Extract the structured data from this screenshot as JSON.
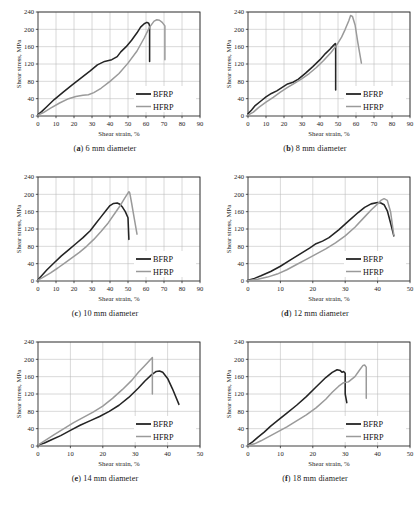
{
  "figure": {
    "panel_captions": [
      {
        "tag": "a",
        "text": " 6 mm diameter"
      },
      {
        "tag": "b",
        "text": " 8 mm diameter"
      },
      {
        "tag": "c",
        "text": " 10 mm diameter"
      },
      {
        "tag": "d",
        "text": " 12 mm diameter"
      },
      {
        "tag": "e",
        "text": " 14 mm diameter"
      },
      {
        "tag": "f",
        "text": " 18 mm diameter"
      }
    ],
    "colors": {
      "bfrp": "#242424",
      "hfrp": "#9a9a9a",
      "grid": "#b9b9b9",
      "axis": "#2b2b2b",
      "background": "#ffffff"
    }
  },
  "chart_data": [
    {
      "id": "a",
      "type": "line",
      "title": "(a) 6 mm diameter",
      "xlabel": "Shear strain, %",
      "ylabel": "Shear stress, MPa",
      "xlim": [
        0,
        90
      ],
      "ylim": [
        0,
        240
      ],
      "xticks": [
        0,
        10,
        20,
        30,
        40,
        50,
        60,
        70,
        80,
        90
      ],
      "yticks": [
        0,
        40,
        80,
        120,
        160,
        200,
        240
      ],
      "grid": true,
      "legend": [
        "BFRP",
        "HFRP"
      ],
      "legend_position": "lower-right",
      "series": [
        {
          "name": "BFRP",
          "x": [
            0,
            2,
            5,
            9,
            14,
            19,
            24,
            29,
            33,
            37,
            41,
            44,
            46,
            49,
            52,
            55,
            57,
            59,
            60.5,
            61.5,
            62,
            62
          ],
          "y": [
            3,
            10,
            22,
            38,
            55,
            72,
            88,
            104,
            118,
            126,
            130,
            137,
            148,
            160,
            175,
            192,
            205,
            213,
            216,
            214,
            208,
            126
          ]
        },
        {
          "name": "HFRP",
          "x": [
            0,
            3,
            7,
            12,
            17,
            21,
            25,
            28,
            31,
            35,
            40,
            45,
            50,
            55,
            59,
            62,
            64.5,
            66,
            67.5,
            69,
            70.5,
            70.5
          ],
          "y": [
            2,
            8,
            18,
            30,
            40,
            45,
            48,
            49,
            54,
            64,
            80,
            98,
            122,
            150,
            180,
            205,
            219,
            222,
            221,
            216,
            208,
            130
          ]
        }
      ]
    },
    {
      "id": "b",
      "type": "line",
      "title": "(b) 8 mm diameter",
      "xlabel": "Shear strain, %",
      "ylabel": "Shear stress, MPa",
      "xlim": [
        0,
        90
      ],
      "ylim": [
        0,
        240
      ],
      "xticks": [
        0,
        10,
        20,
        30,
        40,
        50,
        60,
        70,
        80,
        90
      ],
      "yticks": [
        0,
        40,
        80,
        120,
        160,
        200,
        240
      ],
      "grid": true,
      "legend": [
        "BFRP",
        "HFRP"
      ],
      "legend_position": "lower-right",
      "series": [
        {
          "name": "BFRP",
          "x": [
            0,
            2,
            4,
            7,
            10,
            13,
            16,
            19,
            22,
            25,
            28,
            32,
            36,
            40,
            43,
            45.5,
            47.5,
            48.5,
            48.7,
            48.7
          ],
          "y": [
            5,
            14,
            24,
            34,
            44,
            52,
            58,
            66,
            74,
            78,
            85,
            99,
            114,
            130,
            144,
            154,
            163,
            167,
            166,
            60
          ]
        },
        {
          "name": "HFRP",
          "x": [
            0,
            3,
            6,
            10,
            14,
            18,
            22,
            26,
            30,
            34,
            38,
            42,
            46,
            49,
            52,
            54,
            56,
            57,
            58,
            59.5,
            61,
            63
          ],
          "y": [
            2,
            9,
            20,
            32,
            43,
            55,
            66,
            76,
            86,
            98,
            112,
            128,
            146,
            162,
            182,
            200,
            220,
            232,
            230,
            210,
            170,
            122
          ]
        }
      ]
    },
    {
      "id": "c",
      "type": "line",
      "title": "(c) 10 mm diameter",
      "xlabel": "Shear strain, %",
      "ylabel": "Shear stress, MPa",
      "xlim": [
        0,
        90
      ],
      "ylim": [
        0,
        240
      ],
      "xticks": [
        0,
        10,
        20,
        30,
        40,
        50,
        60,
        70,
        80,
        90
      ],
      "yticks": [
        0,
        40,
        80,
        120,
        160,
        200,
        240
      ],
      "grid": true,
      "legend": [
        "BFRP",
        "HFRP"
      ],
      "legend_position": "lower-right",
      "series": [
        {
          "name": "BFRP",
          "x": [
            0,
            2,
            5,
            9,
            13,
            17,
            21,
            25,
            29,
            32,
            35,
            38,
            40,
            42,
            44,
            45.5,
            47,
            48.5,
            50,
            50.5
          ],
          "y": [
            3,
            12,
            26,
            42,
            58,
            72,
            86,
            100,
            116,
            132,
            148,
            164,
            174,
            179,
            180,
            177,
            170,
            160,
            146,
            96
          ]
        },
        {
          "name": "HFRP",
          "x": [
            0,
            3,
            7,
            11,
            15,
            19,
            23,
            27,
            31,
            35,
            39,
            43,
            46,
            48,
            49.5,
            50.5,
            51,
            52,
            53.5,
            55
          ],
          "y": [
            2,
            9,
            19,
            30,
            42,
            54,
            66,
            80,
            96,
            114,
            134,
            158,
            176,
            190,
            200,
            206,
            203,
            180,
            144,
            108
          ]
        }
      ]
    },
    {
      "id": "d",
      "type": "line",
      "title": "(d) 12 mm diameter",
      "xlabel": "Shear strain, %",
      "ylabel": "Shear stress, MPa",
      "xlim": [
        0,
        50
      ],
      "ylim": [
        0,
        240
      ],
      "xticks": [
        0,
        10,
        20,
        30,
        40,
        50
      ],
      "yticks": [
        0,
        40,
        80,
        120,
        160,
        200,
        240
      ],
      "grid": true,
      "legend": [
        "BFRP",
        "HFRP"
      ],
      "legend_position": "lower-right",
      "series": [
        {
          "name": "BFRP",
          "x": [
            0,
            2,
            4,
            7,
            10,
            13,
            16,
            19,
            21,
            23,
            25,
            28,
            31,
            34,
            36,
            38,
            40,
            41,
            42,
            43,
            44,
            45
          ],
          "y": [
            2,
            6,
            12,
            22,
            34,
            48,
            62,
            76,
            86,
            92,
            100,
            118,
            138,
            158,
            170,
            178,
            181,
            180,
            176,
            162,
            134,
            104
          ]
        },
        {
          "name": "HFRP",
          "x": [
            0,
            3,
            6,
            9,
            12,
            15,
            18,
            21,
            24,
            27,
            30,
            33,
            36,
            38,
            40,
            41,
            42,
            43,
            44,
            45
          ],
          "y": [
            1,
            4,
            9,
            16,
            26,
            38,
            50,
            62,
            74,
            88,
            104,
            124,
            148,
            164,
            178,
            186,
            190,
            186,
            160,
            106
          ]
        }
      ]
    },
    {
      "id": "e",
      "type": "line",
      "title": "(e) 14 mm diameter",
      "xlabel": "Shear strain, %",
      "ylabel": "Shear stress, MPa",
      "xlim": [
        0,
        50
      ],
      "ylim": [
        0,
        240
      ],
      "xticks": [
        0,
        10,
        20,
        30,
        40,
        50
      ],
      "yticks": [
        0,
        40,
        80,
        120,
        160,
        200,
        240
      ],
      "grid": true,
      "legend": [
        "BFRP",
        "HFRP"
      ],
      "legend_position": "lower-right",
      "series": [
        {
          "name": "BFRP",
          "x": [
            0,
            2,
            4,
            7,
            10,
            13,
            16,
            19,
            22,
            25,
            28,
            31,
            33,
            35,
            36.5,
            37.5,
            38.5,
            40,
            41.5,
            43.5
          ],
          "y": [
            2,
            7,
            14,
            24,
            36,
            48,
            58,
            68,
            80,
            94,
            112,
            134,
            150,
            164,
            172,
            173,
            170,
            156,
            132,
            96
          ]
        },
        {
          "name": "HFRP",
          "x": [
            0,
            2,
            5,
            8,
            11,
            14,
            17,
            20,
            23,
            26,
            29,
            31,
            33,
            34.5,
            35.3,
            35.3
          ],
          "y": [
            2,
            12,
            26,
            40,
            54,
            66,
            78,
            92,
            110,
            130,
            152,
            170,
            186,
            198,
            204,
            120
          ]
        }
      ]
    },
    {
      "id": "f",
      "type": "line",
      "title": "(f) 18 mm diameter",
      "xlabel": "Shear strain, %",
      "ylabel": "Shear stress, MPa",
      "xlim": [
        0,
        50
      ],
      "ylim": [
        0,
        240
      ],
      "xticks": [
        0,
        10,
        20,
        30,
        40,
        50
      ],
      "yticks": [
        0,
        40,
        80,
        120,
        160,
        200,
        240
      ],
      "grid": true,
      "legend": [
        "BFRP",
        "HFRP"
      ],
      "legend_position": "lower-right",
      "series": [
        {
          "name": "BFRP",
          "x": [
            0,
            1.5,
            3,
            5,
            7,
            9,
            12,
            15,
            18,
            21,
            24,
            26,
            27.5,
            28.5,
            29,
            29.5,
            30,
            30,
            30.5
          ],
          "y": [
            2,
            10,
            20,
            32,
            46,
            58,
            76,
            94,
            114,
            136,
            158,
            170,
            176,
            174,
            170,
            172,
            168,
            120,
            100
          ]
        },
        {
          "name": "HFRP",
          "x": [
            0,
            2,
            4,
            6,
            9,
            12,
            15,
            18,
            21,
            24,
            26,
            28,
            29.5,
            31,
            33,
            34.5,
            35.5,
            36,
            36.5,
            36.5
          ],
          "y": [
            1,
            5,
            12,
            20,
            32,
            44,
            58,
            72,
            88,
            108,
            124,
            138,
            146,
            148,
            160,
            176,
            186,
            187,
            182,
            110
          ]
        }
      ]
    }
  ]
}
